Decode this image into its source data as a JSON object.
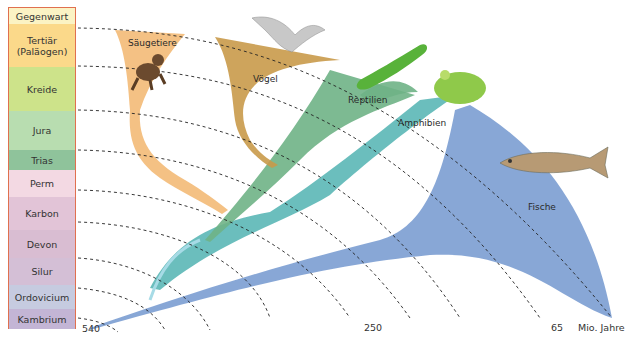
{
  "timeline": {
    "periods": [
      {
        "label": "Gegenwart",
        "color": "#fbf3c4",
        "top": 0,
        "height": 16
      },
      {
        "label": "Tertiär\n(Paläogen)",
        "color": "#fbd98a",
        "top": 16,
        "height": 43
      },
      {
        "label": "Kreide",
        "color": "#cde38a",
        "top": 59,
        "height": 44
      },
      {
        "label": "Jura",
        "color": "#b8ddb0",
        "top": 103,
        "height": 39
      },
      {
        "label": "Trias",
        "color": "#8fc39b",
        "top": 142,
        "height": 20
      },
      {
        "label": "Perm",
        "color": "#f3d9e3",
        "top": 162,
        "height": 27
      },
      {
        "label": "Karbon",
        "color": "#e2c4d7",
        "top": 189,
        "height": 33
      },
      {
        "label": "Devon",
        "color": "#d9bdd2",
        "top": 222,
        "height": 28
      },
      {
        "label": "Silur",
        "color": "#d4bfd6",
        "top": 250,
        "height": 27
      },
      {
        "label": "Ordovicium",
        "color": "#c6cbe0",
        "top": 277,
        "height": 24
      },
      {
        "label": "Kambrium",
        "color": "#c3b5d5",
        "top": 301,
        "height": 21
      }
    ]
  },
  "groups": {
    "saeugetiere": {
      "label": "Säugetiere",
      "color": "#f2b66e"
    },
    "voegel": {
      "label": "Vögel",
      "color": "#c99a4a"
    },
    "reptilien": {
      "label": "Reptilien",
      "color": "#6fb386"
    },
    "amphibien": {
      "label": "Amphibien",
      "color": "#5bb7b6"
    },
    "fische": {
      "label": "Fische",
      "color": "#7e9fd3"
    }
  },
  "axis": {
    "ticks": [
      "540",
      "250",
      "65"
    ],
    "unit": "Mio. Jahre"
  }
}
